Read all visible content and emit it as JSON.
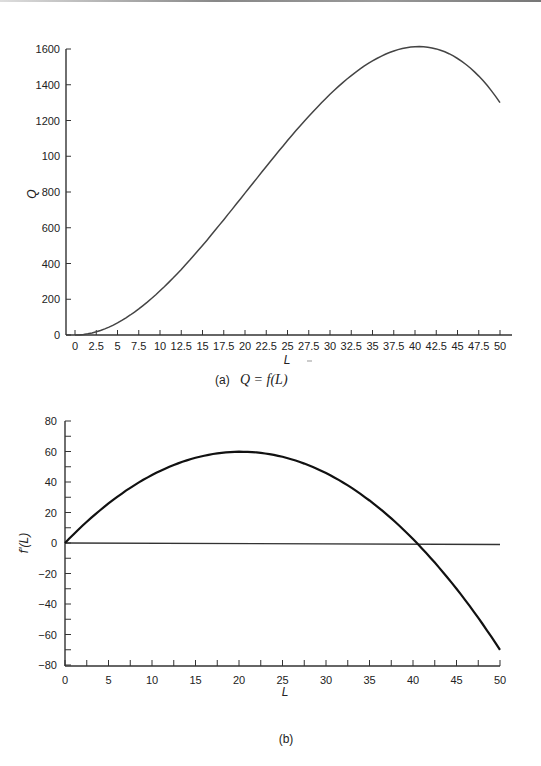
{
  "chart_data": [
    {
      "type": "line",
      "panel": "(a)",
      "caption_label": "(a)",
      "caption_formula": "Q = f(L)",
      "xlabel": "L",
      "ylabel": "Q",
      "xlim": [
        0,
        50
      ],
      "ylim": [
        0,
        1600
      ],
      "x_ticks": [
        "0",
        "2.5",
        "5",
        "7.5",
        "10",
        "12.5",
        "15",
        "17.5",
        "20",
        "22.5",
        "25",
        "27.5",
        "30",
        "32.5",
        "35",
        "37.5",
        "40",
        "42.5",
        "45",
        "47.5",
        "50"
      ],
      "y_ticks": [
        "0",
        "200",
        "400",
        "600",
        "800",
        "100",
        "1200",
        "1400",
        "1600"
      ],
      "grid": false,
      "series": [
        {
          "name": "Q",
          "x": [
            0,
            2.5,
            5,
            7.5,
            10,
            12.5,
            15,
            17.5,
            20,
            22.5,
            25,
            27.5,
            30,
            32.5,
            35,
            37.5,
            40,
            42.5,
            45,
            47.5,
            50
          ],
          "values": [
            0,
            18,
            68,
            146,
            247,
            366,
            500,
            644,
            794,
            946,
            1094,
            1236,
            1366,
            1480,
            1575,
            1645,
            1590,
            1580,
            1530,
            1420,
            1240
          ]
        }
      ]
    },
    {
      "type": "line",
      "panel": "(b)",
      "caption_label": "(b)",
      "xlabel": "L",
      "ylabel": "f'(L)",
      "xlim": [
        0,
        50
      ],
      "ylim": [
        -80,
        80
      ],
      "x_ticks": [
        "0",
        "5",
        "10",
        "15",
        "20",
        "25",
        "30",
        "35",
        "40",
        "45",
        "50"
      ],
      "y_ticks": [
        "80",
        "60",
        "40",
        "20",
        "0",
        "-20",
        "-40",
        "-60",
        "-80"
      ],
      "grid": false,
      "series": [
        {
          "name": "f'(L)",
          "x": [
            0,
            5,
            10,
            15,
            20,
            25,
            30,
            35,
            40,
            45,
            50
          ],
          "values": [
            0,
            26,
            45,
            56,
            60,
            56,
            45,
            26,
            2,
            -29,
            -72
          ]
        },
        {
          "name": "zero line",
          "x": [
            0,
            50
          ],
          "values": [
            0,
            0
          ]
        }
      ]
    }
  ]
}
